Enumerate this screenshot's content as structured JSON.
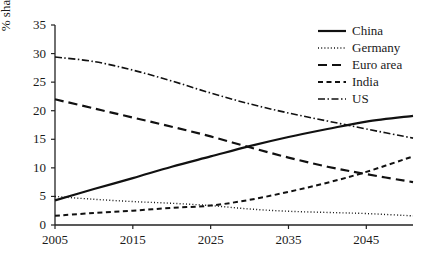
{
  "chart_data": {
    "type": "line",
    "title": "",
    "subtitle": "",
    "xlabel": "",
    "ylabel": "% share of world GDP",
    "xlim": [
      2005,
      2051
    ],
    "ylim": [
      0,
      35
    ],
    "xticks": [
      "2005",
      "2015",
      "2025",
      "2035",
      "2045"
    ],
    "xtick_values": [
      2005,
      2015,
      2025,
      2035,
      2045
    ],
    "yticks": [
      "0",
      "5",
      "10",
      "15",
      "20",
      "25",
      "30",
      "35"
    ],
    "ytick_values": [
      0,
      5,
      10,
      15,
      20,
      25,
      30,
      35
    ],
    "grid": false,
    "legend_position": "top-right",
    "x": [
      2005,
      2010,
      2015,
      2020,
      2025,
      2030,
      2035,
      2040,
      2045,
      2051
    ],
    "series": [
      {
        "name": "China",
        "dash": "solid",
        "color": "#111111",
        "width": 2.2,
        "values": [
          4.3,
          6.3,
          8.2,
          10.2,
          12.0,
          13.8,
          15.4,
          16.8,
          18.1,
          19.1
        ]
      },
      {
        "name": "Germany",
        "dash": "dotted",
        "color": "#111111",
        "width": 1.4,
        "values": [
          5.0,
          4.5,
          4.1,
          3.8,
          3.4,
          2.8,
          2.4,
          2.2,
          2.0,
          1.6
        ]
      },
      {
        "name": "Euro area",
        "dash": "long-dash",
        "color": "#111111",
        "width": 2.2,
        "values": [
          22.0,
          20.4,
          18.8,
          17.2,
          15.5,
          13.6,
          11.8,
          10.2,
          8.9,
          7.5
        ]
      },
      {
        "name": "India",
        "dash": "short-dash",
        "color": "#111111",
        "width": 2.0,
        "values": [
          1.6,
          2.1,
          2.5,
          3.0,
          3.4,
          4.4,
          5.8,
          7.4,
          9.3,
          12.0
        ]
      },
      {
        "name": "US",
        "dash": "dash-dot",
        "color": "#111111",
        "width": 1.6,
        "values": [
          29.4,
          28.6,
          27.1,
          25.2,
          23.1,
          21.2,
          19.6,
          18.2,
          16.8,
          15.2
        ]
      }
    ],
    "annotations": []
  }
}
